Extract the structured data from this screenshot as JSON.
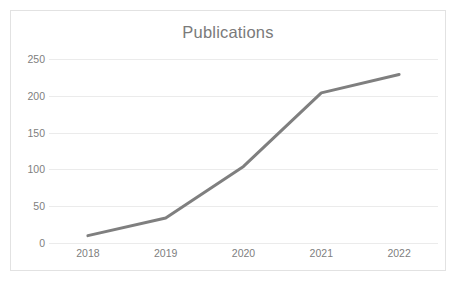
{
  "chart_data": {
    "type": "line",
    "title": "Publications",
    "xlabel": "",
    "ylabel": "",
    "categories": [
      "2018",
      "2019",
      "2020",
      "2021",
      "2022"
    ],
    "x": [
      2018,
      2019,
      2020,
      2021,
      2022
    ],
    "values": [
      10,
      34,
      104,
      204,
      229
    ],
    "series": [
      {
        "name": "Publications",
        "values": [
          10,
          34,
          104,
          204,
          229
        ]
      }
    ],
    "ylim": [
      0,
      250
    ],
    "y_ticks": [
      "0",
      "50",
      "100",
      "150",
      "200",
      "250"
    ],
    "y_tick_values": [
      0,
      50,
      100,
      150,
      200,
      250
    ],
    "x_ticks": [
      "2018",
      "2019",
      "2020",
      "2021",
      "2022"
    ],
    "grid": "horizontal",
    "legend": "none",
    "markers": "none",
    "colors": {
      "line": "#7f7f7f",
      "gridline": "#ebebeb",
      "text": "#808080",
      "title": "#7a7a7a",
      "border": "#e2e2e2",
      "background": "#ffffff"
    },
    "line_width": 3
  }
}
